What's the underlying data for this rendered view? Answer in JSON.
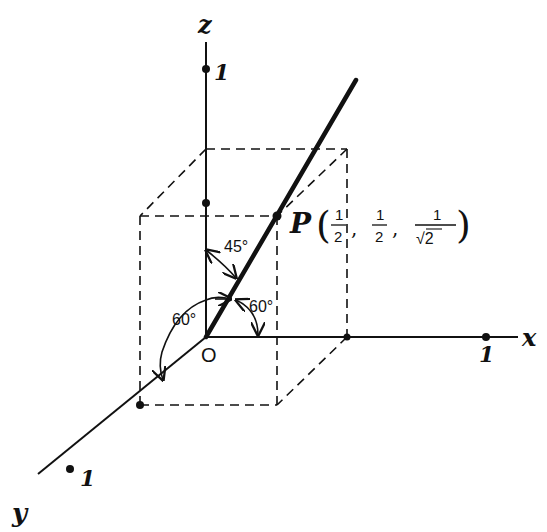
{
  "figure": {
    "type": "3D coordinate axes with unit cube section and direction line",
    "axes": {
      "x": {
        "label": "x",
        "tick_label": "1"
      },
      "y": {
        "label": "y",
        "tick_label": "1"
      },
      "z": {
        "label": "z",
        "tick_label": "1"
      }
    },
    "origin_label": "O",
    "point": {
      "name": "P",
      "coords_text": [
        "1/2",
        "1/2",
        "1/√2"
      ],
      "x_num": "1",
      "x_den": "2",
      "y_num": "1",
      "y_den": "2",
      "z_num": "1",
      "z_den": "√2"
    },
    "angles": {
      "with_z": "45°",
      "with_x": "60°",
      "with_y": "60°"
    },
    "colors": {
      "ink": "#111111",
      "background": "#ffffff"
    }
  }
}
